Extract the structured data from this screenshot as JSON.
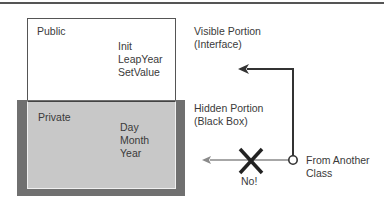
{
  "diagram": {
    "public_section": {
      "title": "Public",
      "members": [
        "Init",
        "LeapYear",
        "SetValue"
      ]
    },
    "private_section": {
      "title": "Private",
      "members": [
        "Day",
        "Month",
        "Year"
      ]
    },
    "annotations": {
      "visible_line1": "Visible Portion",
      "visible_line2": "(Interface)",
      "hidden_line1": "Hidden Portion",
      "hidden_line2": "(Black Box)",
      "source_line1": "From Another",
      "source_line2": "Class",
      "blocked_label": "No!"
    },
    "icons": {
      "allowed_arrow": "arrow-left-icon",
      "blocked_mark": "x-cross-icon",
      "origin": "circle-node-icon"
    },
    "colors": {
      "frame": "#707070",
      "private_fill": "#c8c8c8",
      "line": "#333333",
      "blocked_line": "#8a8a8a"
    }
  }
}
